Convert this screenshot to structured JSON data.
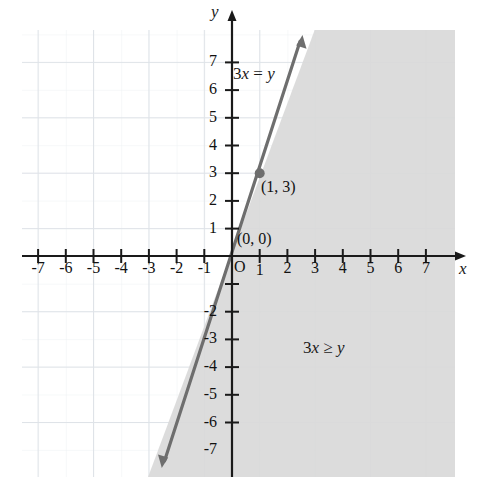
{
  "figure": {
    "width": 478,
    "height": 495,
    "background": "#ffffff"
  },
  "axes": {
    "x_label": "x",
    "y_label": "y",
    "origin_label": "O",
    "x_ticks": [
      "-7",
      "-6",
      "-5",
      "-4",
      "-3",
      "-2",
      "-1",
      "1",
      "2",
      "3",
      "4",
      "5",
      "6",
      "7"
    ],
    "y_ticks": [
      "7",
      "6",
      "5",
      "4",
      "3",
      "2",
      "1",
      "-2",
      "-3",
      "-4",
      "-5",
      "-6",
      "-7"
    ],
    "axis_color": "#1a1a1a",
    "grid_color": "#d8dde4",
    "grid_visible": true
  },
  "annotations": {
    "line_equation": "3x = y",
    "region_inequality": "3x ≥ y",
    "point_origin_label": "(0, 0)",
    "point_one_three_label": "(1, 3)"
  },
  "style": {
    "line_color": "#6e6e6e",
    "shade_color": "#d9d9d9",
    "point_color": "#6e6e6e"
  },
  "chart_data": {
    "type": "line",
    "title": "",
    "xlabel": "x",
    "ylabel": "y",
    "xlim": [
      -8,
      8.3
    ],
    "ylim": [
      -8.3,
      8.3
    ],
    "grid": true,
    "legend": "none",
    "series": [
      {
        "name": "3x = y",
        "type": "line",
        "equation": "y = 3x",
        "slope": 3,
        "intercept": 0,
        "style": "solid",
        "arrows": "both",
        "x": [
          -2.5,
          2.5
        ],
        "y": [
          -7.5,
          7.5
        ],
        "color": "#6e6e6e"
      }
    ],
    "points": [
      {
        "label": "(0, 0)",
        "x": 0,
        "y": 0,
        "marked": false
      },
      {
        "label": "(1, 3)",
        "x": 1,
        "y": 3,
        "marked": true
      }
    ],
    "shaded_region": {
      "label": "3x ≥ y",
      "inequality": "3x >= y",
      "side": "right-of-line",
      "boundary": "solid",
      "color": "#d9d9d9"
    },
    "xticks": [
      -7,
      -6,
      -5,
      -4,
      -3,
      -2,
      -1,
      1,
      2,
      3,
      4,
      5,
      6,
      7
    ],
    "yticks": [
      7,
      6,
      5,
      4,
      3,
      2,
      1,
      -2,
      -3,
      -4,
      -5,
      -6,
      -7
    ]
  }
}
